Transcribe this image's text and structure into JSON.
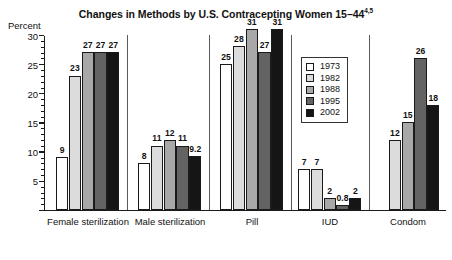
{
  "chart_data": {
    "type": "bar",
    "title": "Changes in Methods by U.S. Contracepting Women 15–44",
    "title_superscript": "4,5",
    "xlabel": "",
    "ylabel": "Percent",
    "ylim": [
      0,
      30
    ],
    "yticks": [
      0,
      5,
      10,
      15,
      20,
      25,
      30
    ],
    "ytick_labels": [
      "0",
      "5",
      "10",
      "15",
      "20",
      "25",
      "30"
    ],
    "grid": false,
    "legend_position": "upper right",
    "categories": [
      "Female sterilization",
      "Male sterilization",
      "Pill",
      "IUD",
      "Condom"
    ],
    "series": [
      {
        "name": "1973",
        "color": "#ffffff",
        "values": [
          9,
          8,
          25,
          7,
          null
        ],
        "labels": [
          "9",
          "8",
          "25",
          "7",
          ""
        ]
      },
      {
        "name": "1982",
        "color": "#dcdcdc",
        "values": [
          23,
          11,
          28,
          7,
          12
        ],
        "labels": [
          "23",
          "11",
          "28",
          "7",
          "12"
        ]
      },
      {
        "name": "1988",
        "color": "#a8a8a8",
        "values": [
          27,
          12,
          31,
          2,
          15
        ],
        "labels": [
          "27",
          "12",
          "31",
          "2",
          "15"
        ]
      },
      {
        "name": "1995",
        "color": "#636363",
        "values": [
          27,
          11,
          27,
          0.8,
          26
        ],
        "labels": [
          "27",
          "11",
          "27",
          "0.8",
          "26"
        ]
      },
      {
        "name": "2002",
        "color": "#151515",
        "values": [
          27,
          9.2,
          31,
          2,
          18
        ],
        "labels": [
          "27",
          "9.2",
          "31",
          "2",
          "18"
        ]
      }
    ]
  },
  "legend": {
    "items": [
      {
        "label": "1973"
      },
      {
        "label": "1982"
      },
      {
        "label": "1988"
      },
      {
        "label": "1995"
      },
      {
        "label": "2002"
      }
    ]
  }
}
